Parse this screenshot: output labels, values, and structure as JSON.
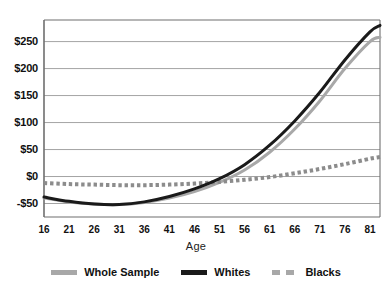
{
  "chart_data": {
    "type": "line",
    "title": "",
    "xlabel": "Age",
    "ylabel": "",
    "xlim": [
      16,
      83
    ],
    "ylim": [
      -75,
      290
    ],
    "grid": true,
    "grid_axis": "y",
    "legend_position": "bottom",
    "y_ticks": [
      -50,
      0,
      50,
      100,
      150,
      200,
      250
    ],
    "y_tick_labels": [
      "-$50",
      "$0",
      "$50",
      "$100",
      "$150",
      "$200",
      "$250"
    ],
    "x_ticks": [
      16,
      21,
      26,
      31,
      36,
      41,
      46,
      51,
      56,
      61,
      66,
      71,
      76,
      81
    ],
    "x_tick_labels": [
      "16",
      "21",
      "26",
      "31",
      "36",
      "41",
      "46",
      "51",
      "56",
      "61",
      "66",
      "71",
      "76",
      "81"
    ],
    "x": [
      16,
      21,
      26,
      31,
      36,
      41,
      46,
      51,
      56,
      61,
      66,
      71,
      76,
      81,
      83
    ],
    "series": [
      {
        "name": "Whole Sample",
        "color": "#a8a8a8",
        "style": "solid",
        "width": 3,
        "values": [
          -40,
          -47,
          -51,
          -52,
          -48,
          -40,
          -28,
          -11,
          12,
          45,
          88,
          140,
          200,
          250,
          258
        ]
      },
      {
        "name": "Whites",
        "color": "#1a1a1a",
        "style": "solid",
        "width": 3,
        "values": [
          -38,
          -46,
          -51,
          -52,
          -47,
          -37,
          -23,
          -4,
          22,
          58,
          103,
          156,
          216,
          268,
          280
        ]
      },
      {
        "name": "Blacks",
        "color": "#8c8c8c",
        "style": "dotted",
        "width": 4,
        "values": [
          -12,
          -14,
          -15,
          -16,
          -16,
          -15,
          -13,
          -10,
          -6,
          -1,
          6,
          14,
          23,
          33,
          36
        ]
      }
    ]
  },
  "axis": {
    "x_title": "Age"
  },
  "legend": {
    "items": [
      {
        "label": "Whole Sample",
        "swatch": "solid-gray"
      },
      {
        "label": "Whites",
        "swatch": "solid-black"
      },
      {
        "label": "Blacks",
        "swatch": "dashed-gray"
      }
    ]
  }
}
